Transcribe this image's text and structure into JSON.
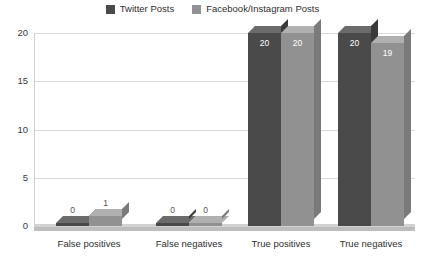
{
  "chart_data": {
    "type": "bar",
    "title": "",
    "subtitle": "",
    "xlabel": "",
    "ylabel": "",
    "ylim": [
      0,
      20
    ],
    "yticks": [
      0,
      5,
      10,
      15,
      20
    ],
    "ytick_labels": [
      "0",
      "5",
      "10",
      "15",
      "20"
    ],
    "grid": true,
    "legend_position": "top-center",
    "style": "3d-column",
    "categories": [
      "False positives",
      "False negatives",
      "True positives",
      "True negatives"
    ],
    "series": [
      {
        "name": "Twitter Posts",
        "color": "#4a4a4a",
        "values": [
          0,
          0,
          20,
          20
        ],
        "value_labels": [
          "0",
          "0",
          "20",
          "20"
        ]
      },
      {
        "name": "Facebook/Instagram Posts",
        "color": "#919191",
        "values": [
          1,
          0,
          20,
          19
        ],
        "value_labels": [
          "1",
          "0",
          "20",
          "19"
        ]
      }
    ]
  },
  "legend": {
    "items": [
      {
        "label": "Twitter Posts",
        "swatch_color": "#4a4a4a",
        "icon": "legend-swatch-icon"
      },
      {
        "label": "Facebook/Instagram Posts",
        "swatch_color": "#919191",
        "icon": "legend-swatch-icon"
      }
    ]
  },
  "colors": {
    "background": "#ffffff",
    "gridline": "#d9d9d9",
    "axis_text": "#3a3a3a",
    "series_1": "#4a4a4a",
    "series_1_top": "#6b6b6b",
    "series_1_side": "#3a3a3a",
    "series_2": "#919191",
    "series_2_top": "#b0b0b0",
    "series_2_side": "#7a7a7a",
    "value_label_inside": "#ffffff",
    "value_label_outside": "#555555",
    "floor_front": "#bdbdbd",
    "floor_top": "#d2d2d2"
  }
}
